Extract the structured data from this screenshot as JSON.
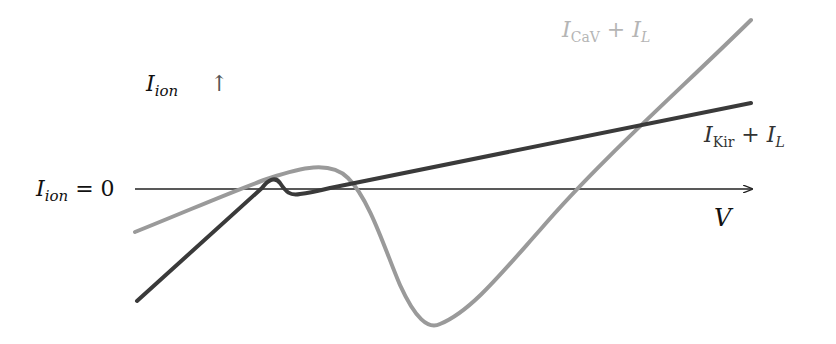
{
  "diagram": {
    "type": "current-voltage schematic",
    "y_axis_label": {
      "main": "I",
      "sub": "ion",
      "suffix": "↑"
    },
    "zero_line_label": {
      "main": "I",
      "sub": "ion",
      "suffix": " = 0"
    },
    "x_axis_label": "V",
    "curves": [
      {
        "id": "kir",
        "label_main": "I",
        "label_sub": "Kir",
        "label_plus": " + ",
        "label_main2": "I",
        "label_sub2": "L",
        "color": "#3a3a3a",
        "description": "N-shaped I-V: rises, small bump above zero, dip, then linear rise"
      },
      {
        "id": "cav",
        "label_main": "I",
        "label_sub": "CaV",
        "label_plus": " + ",
        "label_main2": "I",
        "label_sub2": "L",
        "color": "#9a9a9a",
        "label_color": "#b5b5b5",
        "description": "Rises to hump above zero, deep negative trough, then steep linear rise"
      }
    ],
    "axis_color": "#222222"
  }
}
